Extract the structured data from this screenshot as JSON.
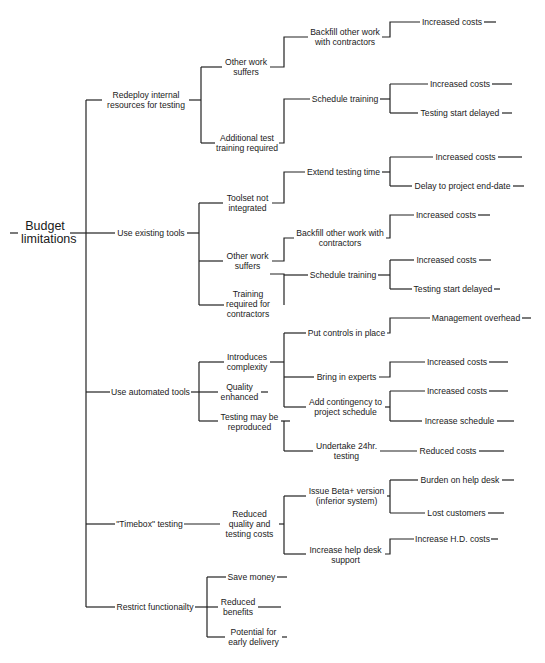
{
  "diagram": {
    "type": "tree",
    "orientation": "left-to-right",
    "root": "Budget limitations",
    "level1": [
      "Redeploy internal resources for testing",
      "Use existing tools",
      "Use automated tools",
      "\"Timebox\" testing",
      "Restrict functionailty"
    ],
    "nodes": {
      "root": "Budget limitations",
      "root_l1": "Budget",
      "root_l2": "limitations",
      "redeploy_l1": "Redeploy internal",
      "redeploy_l2": "resources for testing",
      "redeploy_other_l1": "Other work",
      "redeploy_other_l2": "suffers",
      "redeploy_backfill_l1": "Backfill other work",
      "redeploy_backfill_l2": "with contractors",
      "redeploy_backfill_cost": "Increased costs",
      "redeploy_training_l1": "Additional test",
      "redeploy_training_l2": "training required",
      "redeploy_schedule": "Schedule training",
      "redeploy_schedule_cost": "Increased costs",
      "redeploy_schedule_delay": "Testing start delayed",
      "existing": "Use existing tools",
      "existing_toolset_l1": "Toolset not",
      "existing_toolset_l2": "integrated",
      "existing_extend": "Extend testing time",
      "existing_extend_cost": "Increased costs",
      "existing_extend_delay": "Delay to project end-date",
      "existing_other_l1": "Other work",
      "existing_other_l2": "suffers",
      "existing_backfill_l1": "Backfill other work with",
      "existing_backfill_l2": "contractors",
      "existing_backfill_cost": "Increased costs",
      "existing_training_l1": "Training",
      "existing_training_l2": "required for",
      "existing_training_l3": "contractors",
      "existing_schedule": "Schedule training",
      "existing_schedule_cost": "Increased costs",
      "existing_schedule_delay": "Testing start delayed",
      "automated": "Use automated tools",
      "auto_complex_l1": "Introduces",
      "auto_complex_l2": "complexity",
      "auto_controls": "Put controls in place",
      "auto_controls_overhead": "Management overhead",
      "auto_experts": "Bring in experts",
      "auto_experts_cost": "Increased costs",
      "auto_contingency_l1": "Add contingency to",
      "auto_contingency_l2": "project schedule",
      "auto_contingency_cost": "Increased costs",
      "auto_contingency_schedule": "Increase schedule",
      "auto_quality_l1": "Quality",
      "auto_quality_l2": "enhanced",
      "auto_repro_l1": "Testing may be",
      "auto_repro_l2": "reproduced",
      "auto_24hr_l1": "Undertake 24hr.",
      "auto_24hr_l2": "testing",
      "auto_24hr_cost": "Reduced costs",
      "timebox": "\"Timebox\" testing",
      "timebox_reduced_l1": "Reduced",
      "timebox_reduced_l2": "quality and",
      "timebox_reduced_l3": "testing costs",
      "timebox_beta_l1": "Issue Beta+ version",
      "timebox_beta_l2": "(inferior system)",
      "timebox_beta_burden": "Burden on help desk",
      "timebox_beta_lost": "Lost customers",
      "timebox_helpdesk_l1": "Increase help desk",
      "timebox_helpdesk_l2": "support",
      "timebox_helpdesk_cost": "Increase H.D. costs",
      "restrict": "Restrict functionailty",
      "restrict_save": "Save money",
      "restrict_benefits_l1": "Reduced",
      "restrict_benefits_l2": "benefits",
      "restrict_early_l1": "Potential for",
      "restrict_early_l2": "early delivery"
    },
    "colors": {
      "line": "#222222",
      "text": "#1a1a1a",
      "background": "#ffffff"
    }
  }
}
